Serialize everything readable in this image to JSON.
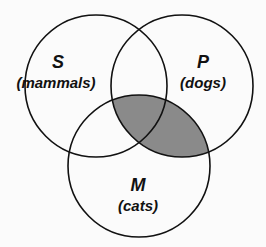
{
  "diagram": {
    "type": "venn",
    "shaded_region": "P∩M",
    "shade_color": "#8a8a8a",
    "stroke_color": "#111111",
    "circles": [
      {
        "id": "S",
        "letter": "S",
        "description": "(mammals)"
      },
      {
        "id": "P",
        "letter": "P",
        "description": "(dogs)"
      },
      {
        "id": "M",
        "letter": "M",
        "description": "(cats)"
      }
    ]
  }
}
